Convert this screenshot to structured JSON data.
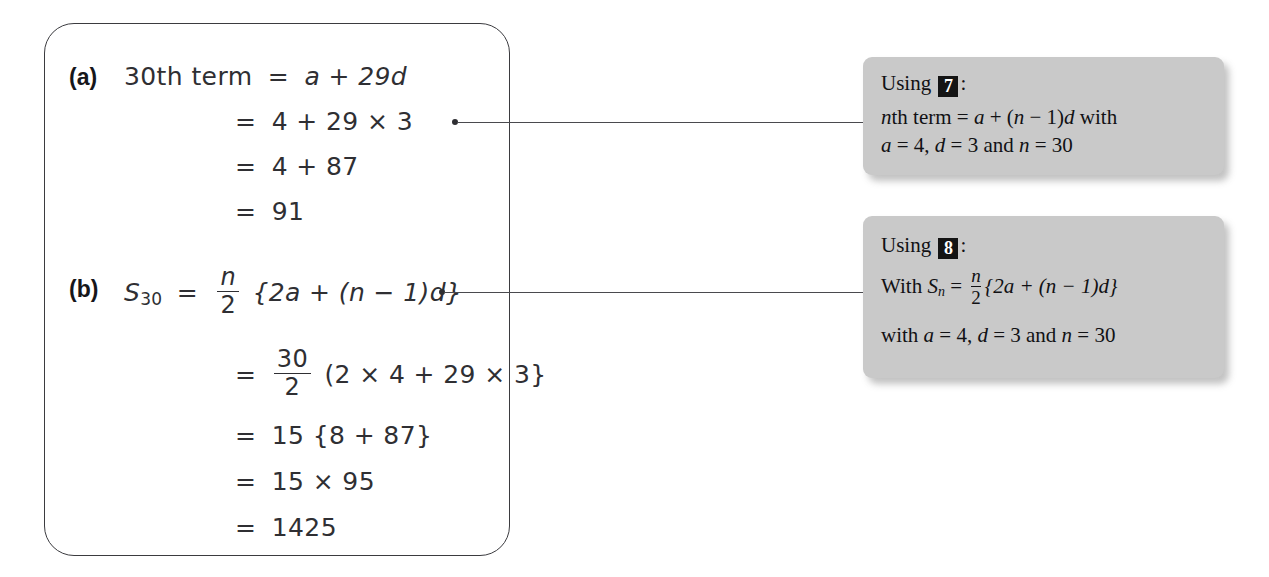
{
  "solution": {
    "parts": [
      {
        "label": "(a)",
        "lines": [
          {
            "lhs": "30th term",
            "rel": "=",
            "rhs": "a + 29d"
          },
          {
            "lhs": "",
            "rel": "=",
            "rhs": "4 + 29 × 3"
          },
          {
            "lhs": "",
            "rel": "=",
            "rhs": "4 + 87"
          },
          {
            "lhs": "",
            "rel": "=",
            "rhs": "91"
          }
        ]
      },
      {
        "label": "(b)",
        "lines": [
          {
            "lhs": "S",
            "sub": "30",
            "rel": "=",
            "frac_num": "n",
            "frac_den": "2",
            "rhs": "{2a + (n − 1)d}"
          },
          {
            "lhs": "",
            "rel": "=",
            "frac_num": "30",
            "frac_den": "2",
            "rhs": "(2 × 4 + 29 × 3}"
          },
          {
            "lhs": "",
            "rel": "=",
            "rhs": "15 {8 + 87}"
          },
          {
            "lhs": "",
            "rel": "=",
            "rhs": "15 × 95"
          },
          {
            "lhs": "",
            "rel": "=",
            "rhs": "1425"
          }
        ]
      }
    ]
  },
  "callouts": [
    {
      "using_label": "Using",
      "badge": "7",
      "colon": ":",
      "body_line1_a": "n",
      "body_line1_b": "th term = ",
      "body_line1_c": "a",
      "body_line1_d": " + (",
      "body_line1_e": "n",
      "body_line1_f": " − 1)",
      "body_line1_g": "d",
      "body_line1_h": " with",
      "body_line2_a": "a",
      "body_line2_b": " = 4, ",
      "body_line2_c": "d",
      "body_line2_d": " = 3 and ",
      "body_line2_e": "n",
      "body_line2_f": " = 30"
    },
    {
      "using_label": "Using",
      "badge": "8",
      "colon": ":",
      "with_label": "With ",
      "s_symbol": "S",
      "s_sub": "n",
      "equals": " = ",
      "frac_num": "n",
      "frac_den": "2",
      "brace_expr": "{2a + (n − 1)d}",
      "body_line2_a": "with ",
      "body_line2_b": "a",
      "body_line2_c": " = 4, ",
      "body_line2_d": "d",
      "body_line2_e": " = 3 and ",
      "body_line2_f": "n",
      "body_line2_g": " = 30"
    }
  ],
  "colors": {
    "box_border": "#3b3b3f",
    "callout_bg": "#c9c9c9",
    "badge_bg": "#141414",
    "ink": "#2f2f33",
    "connector": "#4a4a4e"
  }
}
